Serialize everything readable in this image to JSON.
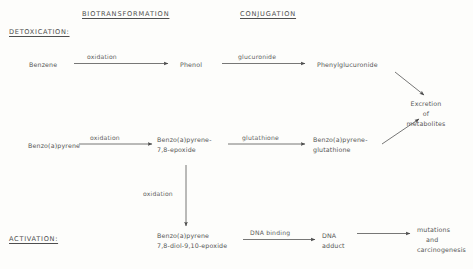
{
  "headers": {
    "biotransformation": "BIOTRANSFORMATION",
    "conjugation": "CONJUGATION"
  },
  "sections": {
    "detoxication": "DETOXICATION:",
    "activation": "ACTIVATION:"
  },
  "nodes": {
    "benzene": "Benzene",
    "phenol": "Phenol",
    "phenylglucuronide": "Phenylglucuronide",
    "benzopyrene": "Benzo(a)pyrene",
    "epoxide_line1": "Benzo(a)pyrene-",
    "epoxide_line2": "7,8-epoxide",
    "glutathione_conj_line1": "Benzo(a)pyrene-",
    "glutathione_conj_line2": "glutathione",
    "excretion_line1": "Excretion",
    "excretion_line2": "of",
    "excretion_line3": "metabolites",
    "diolepoxide_line1": "Benzo(a)pyrene",
    "diolepoxide_line2": "7,8-diol-9,10-epoxide",
    "dna_adduct_line1": "DNA",
    "dna_adduct_line2": "adduct",
    "outcome_line1": "mutations",
    "outcome_line2": "and",
    "outcome_line3": "carcinogenesis"
  },
  "edge_labels": {
    "oxidation_benzene": "oxidation",
    "glucuronide": "glucuronide",
    "oxidation_bap": "oxidation",
    "glutathione": "glutathione",
    "oxidation_vertical": "oxidation",
    "dna_binding": "DNA binding"
  },
  "colors": {
    "background": "#fdfdfb",
    "text": "#555555",
    "stroke": "#4a4a4a"
  }
}
